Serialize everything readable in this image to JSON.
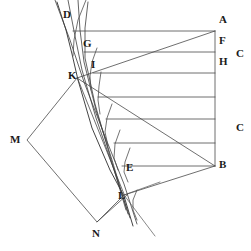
{
  "figure": {
    "background_color": "#ffffff",
    "line_color": "#4a4a4a",
    "label_color": "#1a1a1a",
    "width": 251,
    "height": 251,
    "labels": [
      {
        "id": "A",
        "text": "A",
        "x": 219,
        "y": 20
      },
      {
        "id": "D",
        "text": "D",
        "x": 63,
        "y": 14
      },
      {
        "id": "F",
        "text": "F",
        "x": 219,
        "y": 41
      },
      {
        "id": "C1",
        "text": "C",
        "x": 237,
        "y": 54
      },
      {
        "id": "G",
        "text": "G",
        "x": 84,
        "y": 43
      },
      {
        "id": "H",
        "text": "H",
        "x": 219,
        "y": 63
      },
      {
        "id": "I",
        "text": "I",
        "x": 91,
        "y": 65
      },
      {
        "id": "K",
        "text": "K",
        "x": 69,
        "y": 74
      },
      {
        "id": "C2",
        "text": "C",
        "x": 237,
        "y": 128
      },
      {
        "id": "M",
        "text": "M",
        "x": 11,
        "y": 139
      },
      {
        "id": "B",
        "text": "B",
        "x": 219,
        "y": 164
      },
      {
        "id": "E",
        "text": "E",
        "x": 126,
        "y": 167
      },
      {
        "id": "L",
        "text": "L",
        "x": 118,
        "y": 196
      },
      {
        "id": "N",
        "text": "N",
        "x": 92,
        "y": 233
      }
    ],
    "horizontal_rays": [
      {
        "name": "ray-A",
        "y": 31,
        "x_left": 73,
        "x_right": 215
      },
      {
        "name": "ray-F",
        "y": 52,
        "x_left": 84,
        "x_right": 215
      },
      {
        "name": "ray-H",
        "y": 73,
        "x_left": 93,
        "x_right": 215
      },
      {
        "name": "ray-4",
        "y": 97,
        "x_left": 98,
        "x_right": 215
      },
      {
        "name": "ray-5",
        "y": 119,
        "x_left": 106,
        "x_right": 215
      },
      {
        "name": "ray-6",
        "y": 143,
        "x_left": 114,
        "x_right": 215
      },
      {
        "name": "ray-B",
        "y": 166,
        "x_left": 122,
        "x_right": 215
      }
    ],
    "vertical_axis": {
      "name": "axis-AB",
      "x": 215,
      "y_top": 31,
      "y_bottom": 166
    },
    "converging_lines": [
      {
        "name": "line-A-to-K",
        "x1": 215,
        "y1": 31,
        "x2": 77,
        "y2": 78
      },
      {
        "name": "line-B-to-K",
        "x1": 215,
        "y1": 166,
        "x2": 77,
        "y2": 78
      },
      {
        "name": "line-B-to-L",
        "x1": 215,
        "y1": 166,
        "x2": 124,
        "y2": 195
      }
    ],
    "refracting_surface": {
      "name": "surface-D-L",
      "points": "57,2 66,30 72,54 78,80 92,128 110,170 124,196 133,226"
    },
    "quadrilateral": {
      "name": "prism-M-K-L-N",
      "points": "77,78 27,140 97,222 124,195"
    },
    "ray_bundle": [
      {
        "name": "ray-bundle-1",
        "points": "55,0 70,40 84,82 104,134 124,184 137,224"
      },
      {
        "name": "ray-bundle-2",
        "points": "68,0 75,36 82,70 96,118 114,170 130,218"
      },
      {
        "name": "ray-bundle-3",
        "points": "78,0 80,30 84,62 96,110 112,160 128,214"
      },
      {
        "name": "ray-bundle-4",
        "points": "88,2 85,28 85,58 95,104 110,156 126,210"
      }
    ],
    "short_arcs": [
      {
        "name": "arc-top",
        "points": "86,0 78,20 74,40 73,56"
      },
      {
        "name": "arc-G",
        "points": "97,48 92,62 90,76 91,90"
      },
      {
        "name": "arc-I",
        "points": "101,72 99,86 98,100 100,114"
      },
      {
        "name": "arc-mid",
        "points": "112,104 107,118 105,132 108,146"
      },
      {
        "name": "arc-low",
        "points": "120,130 115,144 114,158 118,170"
      },
      {
        "name": "arc-E",
        "points": "130,148 125,162 124,172 128,182"
      },
      {
        "name": "arc-L",
        "points": "137,190 133,200 133,210 137,220"
      }
    ],
    "extra_rays": [
      {
        "name": "ray-N-to-L",
        "x1": 97,
        "y1": 222,
        "x2": 128,
        "y2": 194
      },
      {
        "name": "ray-L-down-right",
        "x1": 124,
        "y1": 195,
        "x2": 155,
        "y2": 236
      },
      {
        "name": "ray-L-right",
        "x1": 124,
        "y1": 195,
        "x2": 160,
        "y2": 182
      }
    ]
  }
}
